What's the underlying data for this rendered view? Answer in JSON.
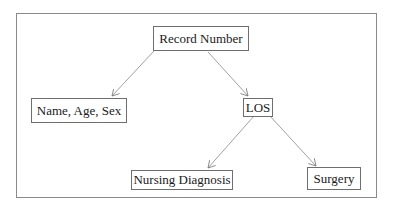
{
  "diagram": {
    "type": "tree",
    "nodes": [
      {
        "id": "record_number",
        "label": "Record Number"
      },
      {
        "id": "name_age_sex",
        "label": "Name, Age, Sex"
      },
      {
        "id": "los",
        "label": "LOS"
      },
      {
        "id": "nursing_diagnosis",
        "label": "Nursing Diagnosis"
      },
      {
        "id": "surgery",
        "label": "Surgery"
      }
    ],
    "edges": [
      {
        "from": "record_number",
        "to": "name_age_sex"
      },
      {
        "from": "record_number",
        "to": "los"
      },
      {
        "from": "los",
        "to": "nursing_diagnosis"
      },
      {
        "from": "los",
        "to": "surgery"
      }
    ]
  }
}
